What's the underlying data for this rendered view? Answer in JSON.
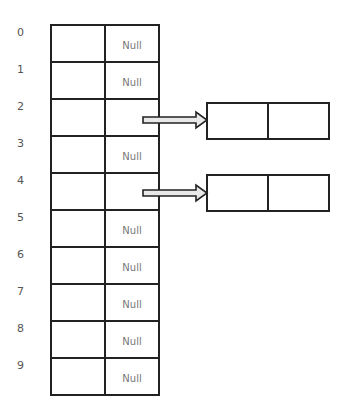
{
  "diagram": {
    "type": "hash-table-chaining",
    "indices": [
      "0",
      "1",
      "2",
      "3",
      "4",
      "5",
      "6",
      "7",
      "8",
      "9"
    ],
    "slots": [
      "Null",
      "Null",
      "",
      "Null",
      "",
      "Null",
      "Null",
      "Null",
      "Null",
      "Null"
    ],
    "pointers": [
      {
        "from_index": 2,
        "to": "node-1"
      },
      {
        "from_index": 4,
        "to": "node-2"
      }
    ],
    "nodes": [
      {
        "id": "node-1",
        "fields": [
          "",
          ""
        ]
      },
      {
        "id": "node-2",
        "fields": [
          "",
          ""
        ]
      }
    ]
  }
}
